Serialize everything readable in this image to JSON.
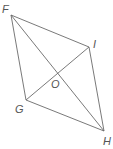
{
  "diagram": {
    "title": "",
    "shape": "quadrilateral FIHG with diagonals FH and GI intersecting at O",
    "stroke_color": "#6a6a6a",
    "label_color": "#555555",
    "vertices": {
      "F": {
        "label": "F",
        "x": 11,
        "y": 15,
        "label_x": 2,
        "label_y": 13
      },
      "I": {
        "label": "I",
        "x": 89,
        "y": 47,
        "label_x": 94,
        "label_y": 47
      },
      "H": {
        "label": "H",
        "x": 104,
        "y": 131,
        "label_x": 103,
        "label_y": 145
      },
      "G": {
        "label": "G",
        "x": 26,
        "y": 100,
        "label_x": 16,
        "label_y": 113
      }
    },
    "intersection": {
      "label": "O",
      "x": 57,
      "y": 72,
      "label_x": 51,
      "label_y": 88
    },
    "edges": [
      {
        "from": "F",
        "to": "I"
      },
      {
        "from": "I",
        "to": "H"
      },
      {
        "from": "H",
        "to": "G"
      },
      {
        "from": "G",
        "to": "F"
      }
    ],
    "diagonals": [
      {
        "from": "F",
        "to": "H"
      },
      {
        "from": "G",
        "to": "I"
      }
    ]
  }
}
